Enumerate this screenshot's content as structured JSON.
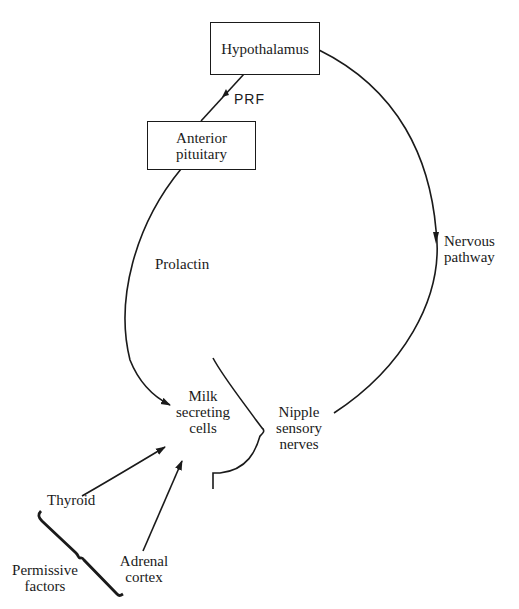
{
  "diagram": {
    "nodes": {
      "hypothalamus": {
        "label": "Hypothalamus"
      },
      "anterior_pituitary": {
        "label_line1": "Anterior",
        "label_line2": "pituitary"
      },
      "milk_cells": {
        "label_line1": "Milk",
        "label_line2": "secreting",
        "label_line3": "cells"
      },
      "nipple": {
        "label_line1": "Nipple",
        "label_line2": "sensory",
        "label_line3": "nerves"
      },
      "thyroid": {
        "label": "Thyroid"
      },
      "adrenal": {
        "label_line1": "Adrenal",
        "label_line2": "cortex"
      },
      "permissive": {
        "label_line1": "Permissive",
        "label_line2": "factors"
      }
    },
    "edges": {
      "prf": {
        "label": "PRF"
      },
      "prolactin": {
        "label": "Prolactin"
      },
      "nervous": {
        "label_line1": "Nervous",
        "label_line2": "pathway"
      }
    }
  }
}
